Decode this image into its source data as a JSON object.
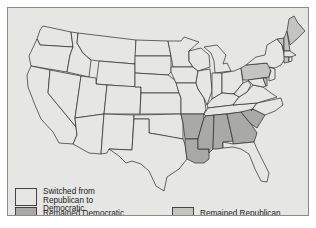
{
  "map": {
    "title": "",
    "colors": {
      "background": "#e6e6e4",
      "switched": "#e6e6e4",
      "remained_democratic": "#a9a9a7",
      "remained_republican": "#c4c4c2",
      "border": "#2a2a2a"
    },
    "states": {
      "remained_democratic": [
        "Arkansas",
        "Louisiana",
        "Mississippi",
        "Alabama",
        "Georgia",
        "South Carolina"
      ],
      "remained_republican": [
        "Pennsylvania",
        "Vermont",
        "New Hampshire",
        "Maine",
        "Connecticut",
        "Delaware"
      ],
      "switched_republican_to_democratic": "all other states"
    }
  },
  "legend": {
    "items": [
      {
        "key": "switched",
        "label": "Switched from\nRepublican to\nDemocratic"
      },
      {
        "key": "remained_democratic",
        "label": "Remained Democratic"
      },
      {
        "key": "remained_republican",
        "label": "Remained Republican"
      }
    ]
  }
}
